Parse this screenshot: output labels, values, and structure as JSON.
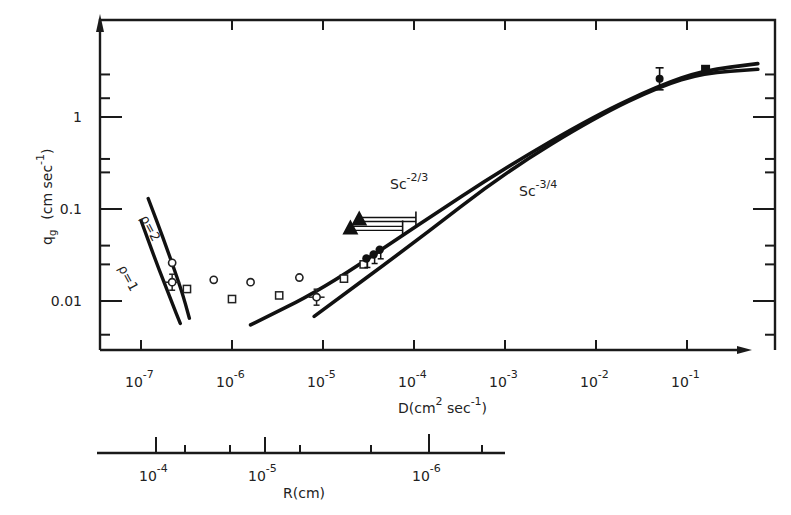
{
  "chart_data": {
    "type": "scatter",
    "title": "",
    "xlabel": "D(cm² sec⁻¹)",
    "xlabel_parts": {
      "base": "D(cm",
      "sup1": "2",
      "mid": " sec",
      "sup2": "-1",
      "end": ")"
    },
    "ylabel": "q_g (cm sec⁻¹)",
    "ylabel_parts": {
      "q": "q",
      "sub": "g",
      "unit": "(cm sec",
      "sup": "-1",
      "end": ")"
    },
    "x_scale": "log",
    "y_scale": "log",
    "xlim": [
      5e-08,
      1.0
    ],
    "ylim": [
      0.004,
      3.5
    ],
    "grid": false,
    "x_ticks": [
      {
        "value": 1e-07,
        "mant": "10",
        "exp": "-7"
      },
      {
        "value": 1e-06,
        "mant": "10",
        "exp": "-6"
      },
      {
        "value": 1e-05,
        "mant": "10",
        "exp": "-5"
      },
      {
        "value": 0.0001,
        "mant": "10",
        "exp": "-4"
      },
      {
        "value": 0.001,
        "mant": "10",
        "exp": "-3"
      },
      {
        "value": 0.01,
        "mant": "10",
        "exp": "-2"
      },
      {
        "value": 0.1,
        "mant": "10",
        "exp": "-1"
      }
    ],
    "y_ticks": [
      {
        "value": 1,
        "label": "1"
      },
      {
        "value": 0.1,
        "label": "0.1"
      },
      {
        "value": 0.01,
        "label": "0.01"
      }
    ],
    "secondary_x_axis": {
      "label": "R(cm)",
      "scale": "log (reversed)",
      "ticks": [
        {
          "value": 0.0001,
          "mant": "10",
          "exp": "-4"
        },
        {
          "value": 1e-05,
          "mant": "10",
          "exp": "-5"
        },
        {
          "value": 1e-06,
          "mant": "10",
          "exp": "-6"
        }
      ]
    },
    "series": [
      {
        "name": "Sc^-2/3",
        "kind": "line",
        "label_main": "Sc",
        "label_sup": "-2/3",
        "x": [
          1.6e-06,
          1e-05,
          0.0001,
          0.001,
          0.01,
          0.05,
          0.15,
          0.6
        ],
        "y": [
          0.0055,
          0.0135,
          0.063,
          0.28,
          1.05,
          2.2,
          3.2,
          3.8
        ]
      },
      {
        "name": "Sc^-3/4",
        "kind": "line",
        "label_main": "Sc",
        "label_sup": "-3/4",
        "x": [
          8e-06,
          0.0001,
          0.001,
          0.01,
          0.05,
          0.15,
          0.6
        ],
        "y": [
          0.0068,
          0.043,
          0.25,
          1.0,
          2.15,
          3.0,
          3.3
        ]
      },
      {
        "name": "ρ=2",
        "kind": "line",
        "label": "ρ=2",
        "x": [
          1.2e-07,
          1.8e-07,
          2.8e-07,
          3.4e-07
        ],
        "y": [
          0.13,
          0.045,
          0.013,
          0.0065
        ]
      },
      {
        "name": "ρ=1",
        "kind": "line",
        "label": "ρ=1",
        "x": [
          1e-07,
          1.5e-07,
          2.2e-07,
          2.7e-07
        ],
        "y": [
          0.075,
          0.025,
          0.0095,
          0.0057
        ]
      },
      {
        "name": "open circles",
        "kind": "marker",
        "marker": "circle-open",
        "x": [
          2.2e-07,
          6.3e-07,
          1.6e-06,
          5.5e-06
        ],
        "y": [
          0.026,
          0.017,
          0.016,
          0.018
        ]
      },
      {
        "name": "open circle with error bars",
        "kind": "marker",
        "marker": "circle-open-err",
        "x": [
          2.2e-07,
          8.5e-06
        ],
        "y": [
          0.016,
          0.011
        ]
      },
      {
        "name": "open squares",
        "kind": "marker",
        "marker": "square-open",
        "x": [
          3.2e-07,
          1e-06,
          3.3e-06,
          1.7e-05,
          2.8e-05
        ],
        "y": [
          0.0135,
          0.0105,
          0.0115,
          0.0175,
          0.025
        ]
      },
      {
        "name": "filled circles",
        "kind": "marker",
        "marker": "circle-filled",
        "x": [
          3e-05,
          3.6e-05,
          4.2e-05
        ],
        "y": [
          0.029,
          0.032,
          0.036
        ]
      },
      {
        "name": "filled triangles",
        "kind": "marker",
        "marker": "triangle-filled",
        "x": [
          2e-05,
          2.5e-05
        ],
        "y": [
          0.06,
          0.075
        ],
        "x_error_to": [
          7.5e-05,
          0.000105
        ]
      },
      {
        "name": "filled squares (high D)",
        "kind": "marker",
        "marker": "square-filled",
        "x": [
          0.16
        ],
        "y": [
          3.3
        ]
      },
      {
        "name": "error point (high D)",
        "kind": "marker",
        "marker": "diamond-err",
        "x": [
          0.05
        ],
        "y": [
          2.6
        ]
      }
    ]
  }
}
